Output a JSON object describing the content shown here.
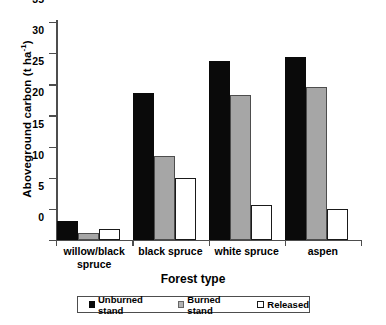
{
  "chart_data": {
    "type": "bar",
    "title": "",
    "xlabel": "Forest type",
    "ylabel": "Aboveground carbon (t ha",
    "ylabel_sup": "-1",
    "ylabel_tail": ")",
    "categories": [
      "willow/black spruce",
      "black spruce",
      "white spruce",
      "aspen"
    ],
    "category_lines": [
      [
        "willow/black",
        "spruce"
      ],
      [
        "black spruce"
      ],
      [
        "white spruce"
      ],
      [
        "aspen"
      ]
    ],
    "series": [
      {
        "name": "Unburned stand",
        "color": "#0a0a0a",
        "values": [
          3.1,
          23.6,
          28.8,
          29.4
        ]
      },
      {
        "name": "Burned stand",
        "color": "#a6a6a6",
        "values": [
          1.2,
          13.5,
          23.3,
          24.6
        ]
      },
      {
        "name": "Released",
        "color": "#ffffff",
        "values": [
          1.8,
          10.0,
          5.6,
          5.0
        ]
      }
    ],
    "ylim": [
      0,
      35
    ],
    "yticks": [
      0,
      5,
      10,
      15,
      20,
      25,
      30,
      35
    ],
    "ytick_labels": [
      "0",
      "5",
      "10",
      "15",
      "20",
      "25",
      "30",
      "35"
    ],
    "grid": false,
    "legend_position": "bottom",
    "legend_entries": [
      "Unburned stand",
      "Burned stand",
      "Released"
    ]
  }
}
